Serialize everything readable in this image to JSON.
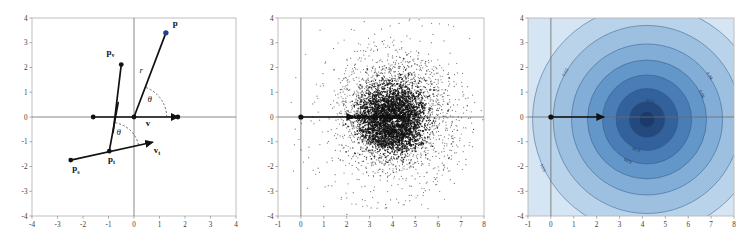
{
  "figure": {
    "panel_count": 3,
    "background_color": "#ffffff"
  },
  "chart_data": [
    {
      "type": "scatter",
      "title": "",
      "panel": "left",
      "description": "Vector diagram of polar decomposition of a point p relative to a source point p_s and target point p_t",
      "xlabel": "",
      "ylabel": "",
      "xlim": [
        -4,
        4
      ],
      "ylim": [
        -4,
        4
      ],
      "xticks": [
        -4,
        -3,
        -2,
        -1,
        0,
        1,
        2,
        3,
        4
      ],
      "yticks": [
        -4,
        -3,
        -2,
        -1,
        0,
        1,
        2,
        3,
        4
      ],
      "grid": false,
      "axes_through_origin": true,
      "points": [
        {
          "name": "p",
          "x": 1.25,
          "y": 3.4,
          "color": "#27408b",
          "label": "p"
        },
        {
          "name": "p_v",
          "x": -0.5,
          "y": 2.12,
          "color": "#111111",
          "label": "p"
        },
        {
          "name": "origin",
          "x": 0.0,
          "y": 0.0,
          "color": "#111111",
          "label": ""
        },
        {
          "name": "v_tail",
          "x": -1.6,
          "y": 0.0,
          "color": "#111111",
          "label": ""
        },
        {
          "name": "v_head",
          "x": 1.72,
          "y": 0.0,
          "color": "#111111",
          "label": ""
        },
        {
          "name": "p_s",
          "x": -2.48,
          "y": -1.74,
          "color": "#111111",
          "label": "p"
        },
        {
          "name": "p_t",
          "x": -0.97,
          "y": -1.38,
          "color": "#111111",
          "label": "p"
        },
        {
          "name": "v_t_head",
          "x": 0.72,
          "y": -1.02,
          "color": "#111111",
          "label": "v"
        }
      ],
      "segments": [
        {
          "from": [
            0,
            0
          ],
          "to": [
            1.25,
            3.4
          ],
          "label": "r"
        },
        {
          "from": [
            -0.5,
            2.12
          ],
          "to": [
            -0.82,
            -0.62
          ],
          "label": ""
        },
        {
          "from": [
            -1.6,
            0
          ],
          "to": [
            1.72,
            0
          ],
          "label": "v"
        },
        {
          "from": [
            -2.48,
            -1.74
          ],
          "to": [
            0.72,
            -1.02
          ],
          "label": ""
        },
        {
          "from": [
            -0.97,
            -1.38
          ],
          "to": [
            -0.62,
            0.58
          ],
          "label": ""
        }
      ],
      "angles": [
        {
          "label": "θ",
          "vertex": [
            0,
            0
          ],
          "x": 0.62,
          "y": 0.62
        },
        {
          "label": "θ",
          "vertex": [
            -0.97,
            -1.38
          ],
          "x": -0.6,
          "y": -0.72
        }
      ],
      "labels": [
        {
          "text": "p",
          "sub": "",
          "x": 1.62,
          "y": 3.68,
          "bold": true
        },
        {
          "text": "p",
          "sub": "v",
          "x": -0.92,
          "y": 2.5,
          "bold": true
        },
        {
          "text": "p",
          "sub": "s",
          "x": -2.28,
          "y": -2.2,
          "bold": true
        },
        {
          "text": "p",
          "sub": "t",
          "x": -0.88,
          "y": -1.82,
          "bold": true
        },
        {
          "text": "v",
          "sub": "",
          "x": 0.55,
          "y": -0.38,
          "bold": true
        },
        {
          "text": "v",
          "sub": "t",
          "x": 0.9,
          "y": -1.45,
          "bold": true
        },
        {
          "text": "r",
          "sub": "",
          "x": 0.28,
          "y": 1.78,
          "bold": false
        }
      ]
    },
    {
      "type": "scatter",
      "title": "",
      "panel": "middle",
      "description": "Dense scatter of sampled trajectories forming a swirling cloud centered near x=4, y=0 with an arrow along the x-axis from 0 to about 2.3",
      "xlabel": "",
      "ylabel": "",
      "xlim": [
        -1,
        8
      ],
      "ylim": [
        -4,
        4
      ],
      "xticks": [
        -1,
        0,
        1,
        2,
        3,
        4,
        5,
        6,
        7,
        8
      ],
      "yticks": [
        -4,
        -3,
        -2,
        -1,
        0,
        1,
        2,
        3,
        4
      ],
      "grid": false,
      "axes_through_origin": true,
      "cloud_center": [
        4.05,
        -0.05
      ],
      "cloud_radius_x": 2.6,
      "cloud_radius_y": 2.7,
      "point_count": 2600,
      "point_color": "#1a1a1a",
      "arrow": {
        "from": [
          0,
          0
        ],
        "to": [
          2.3,
          0
        ]
      },
      "origin_marker": {
        "x": 0,
        "y": 0
      }
    },
    {
      "type": "contour",
      "title": "",
      "panel": "right",
      "description": "Filled concentric contour map (density estimate) centered near x=4.2, y=-0.1 with an arrow along the x-axis from 0 to about 2.3",
      "xlabel": "",
      "ylabel": "",
      "xlim": [
        -1,
        8
      ],
      "ylim": [
        -4,
        4
      ],
      "xticks": [
        -1,
        0,
        1,
        2,
        3,
        4,
        5,
        6,
        7,
        8
      ],
      "yticks": [
        -4,
        -3,
        -2,
        -1,
        0,
        1,
        2,
        3,
        4
      ],
      "grid": false,
      "axes_through_origin": true,
      "center": [
        4.2,
        -0.1
      ],
      "levels": [
        {
          "value": "0.01",
          "radius_x": 5.0,
          "radius_y": 4.6,
          "fill": "#b9d3ea"
        },
        {
          "value": "0.02",
          "radius_x": 4.1,
          "radius_y": 3.8,
          "fill": "#9dc0e0"
        },
        {
          "value": "0.04",
          "radius_x": 3.3,
          "radius_y": 3.05,
          "fill": "#81add6"
        },
        {
          "value": "0.06",
          "radius_x": 2.6,
          "radius_y": 2.4,
          "fill": "#6497c9"
        },
        {
          "value": "0.08",
          "radius_x": 1.95,
          "radius_y": 1.8,
          "fill": "#4a7cb5"
        },
        {
          "value": "0.10",
          "radius_x": 1.35,
          "radius_y": 1.25,
          "fill": "#33619c"
        },
        {
          "value": "0.12",
          "radius_x": 0.78,
          "radius_y": 0.72,
          "fill": "#24497f"
        },
        {
          "value": "0.14",
          "radius_x": 0.34,
          "radius_y": 0.32,
          "fill": "#1a3a6b"
        }
      ],
      "background_fill": "#d6e5f3",
      "contour_line_color": "#2b4f7d",
      "arrow": {
        "from": [
          0,
          0
        ],
        "to": [
          2.3,
          0
        ]
      },
      "origin_marker": {
        "x": 0,
        "y": 0
      },
      "contour_labels": [
        "0.01",
        "0.02",
        "0.04",
        "0.06",
        "0.08",
        "0.10",
        "0.12"
      ]
    }
  ]
}
